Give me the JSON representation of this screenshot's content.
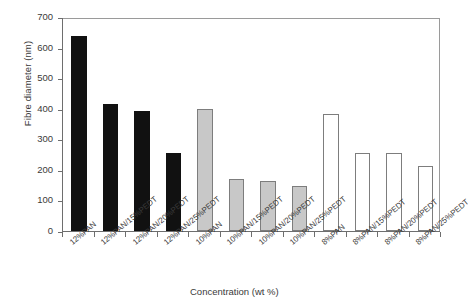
{
  "chart_data": {
    "type": "bar",
    "title": "",
    "xlabel": "Concentration (wt %)",
    "ylabel": "Fibre diameter (nm)",
    "ylim": [
      0,
      700
    ],
    "ytick_labels": [
      "0",
      "100",
      "200",
      "300",
      "400",
      "500",
      "600",
      "700"
    ],
    "ytick_values": [
      0,
      100,
      200,
      300,
      400,
      500,
      600,
      700
    ],
    "grid": false,
    "legend": "none",
    "categories": [
      "12%PAN",
      "12%PAN/15%PEDT",
      "12%PAN/20%PEDT",
      "12%PAN/25%PEDT",
      "10%PAN",
      "10%PAN/15%PEDT",
      "10%PAN/20%PEDT",
      "10%PAN/25%PEDT",
      "8%PAN",
      "8%PAN/15%PEDT",
      "8%PAN/20%PEDT",
      "8%PAN/25%PEDT"
    ],
    "values": [
      638,
      415,
      394,
      256,
      400,
      170,
      163,
      148,
      382,
      255,
      255,
      213
    ],
    "bar_colors": [
      "black",
      "black",
      "black",
      "black",
      "gray",
      "gray",
      "gray",
      "gray",
      "white",
      "white",
      "white",
      "white"
    ],
    "color_hex": {
      "black": "#111111",
      "gray": "#c8c8c8",
      "white": "#ffffff",
      "outline": "#7d7d7d",
      "axis": "#6e6e6e"
    }
  }
}
